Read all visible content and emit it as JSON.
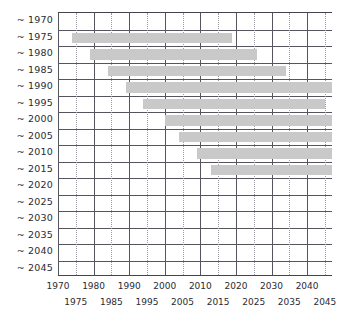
{
  "chart_data": {
    "type": "bar",
    "orientation": "horizontal",
    "title": "",
    "xlabel": "",
    "ylabel": "",
    "xlim": [
      1970,
      2047
    ],
    "grid": true,
    "legend": null,
    "bar_color": "#c9c9c9",
    "axis_color": "#55555d",
    "gridline_solid_years": [
      1970,
      1980,
      1990,
      2000,
      2010,
      2020,
      2030,
      2040
    ],
    "gridline_dotted_years": [
      1975,
      1985,
      1995,
      2005,
      2015,
      2025,
      2035,
      2045
    ],
    "categories": [
      "~ 1970",
      "~ 1975",
      "~ 1980",
      "~ 1985",
      "~ 1990",
      "~ 1995",
      "~ 2000",
      "~ 2005",
      "~ 2010",
      "~ 2015",
      "~ 2020",
      "~ 2025",
      "~ 2030",
      "~ 2035",
      "~ 2040",
      "~ 2045"
    ],
    "xticks_row1": [
      1970,
      1980,
      1990,
      2000,
      2010,
      2020,
      2030,
      2040
    ],
    "xticks_row2": [
      1975,
      1985,
      1995,
      2005,
      2015,
      2025,
      2035,
      2045
    ],
    "bars": [
      {
        "category": "~ 1970",
        "start": null,
        "end": null
      },
      {
        "category": "~ 1975",
        "start": 1974,
        "end": 2019
      },
      {
        "category": "~ 1980",
        "start": 1979,
        "end": 2026
      },
      {
        "category": "~ 1985",
        "start": 1984,
        "end": 2034
      },
      {
        "category": "~ 1990",
        "start": 1989,
        "end": 2047
      },
      {
        "category": "~ 1995",
        "start": 1994,
        "end": 2045
      },
      {
        "category": "~ 2000",
        "start": 2000,
        "end": 2047
      },
      {
        "category": "~ 2005",
        "start": 2004,
        "end": 2047
      },
      {
        "category": "~ 2010",
        "start": 2009,
        "end": 2047
      },
      {
        "category": "~ 2015",
        "start": 2013,
        "end": 2047
      },
      {
        "category": "~ 2020",
        "start": null,
        "end": null
      },
      {
        "category": "~ 2025",
        "start": null,
        "end": null
      },
      {
        "category": "~ 2030",
        "start": null,
        "end": null
      },
      {
        "category": "~ 2035",
        "start": null,
        "end": null
      },
      {
        "category": "~ 2040",
        "start": null,
        "end": null
      },
      {
        "category": "~ 2045",
        "start": null,
        "end": null
      }
    ]
  }
}
